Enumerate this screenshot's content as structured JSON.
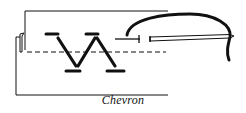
{
  "diagram": {
    "title": "Chevron",
    "caption": "Chevron",
    "elements": [
      {
        "name": "fabric-outline",
        "description": "folded fabric edge outline"
      },
      {
        "name": "guide-line",
        "description": "dashed horizontal guide line"
      },
      {
        "name": "top-bar-stitches",
        "count": 2
      },
      {
        "name": "bottom-bar-stitches",
        "count": 2
      },
      {
        "name": "diagonal-stitches",
        "count": 3
      },
      {
        "name": "needle",
        "description": "needle pointing left"
      },
      {
        "name": "working-thread",
        "description": "thread arching over to the right"
      }
    ],
    "colors": {
      "ink": "#111111",
      "background": "#ffffff"
    }
  }
}
